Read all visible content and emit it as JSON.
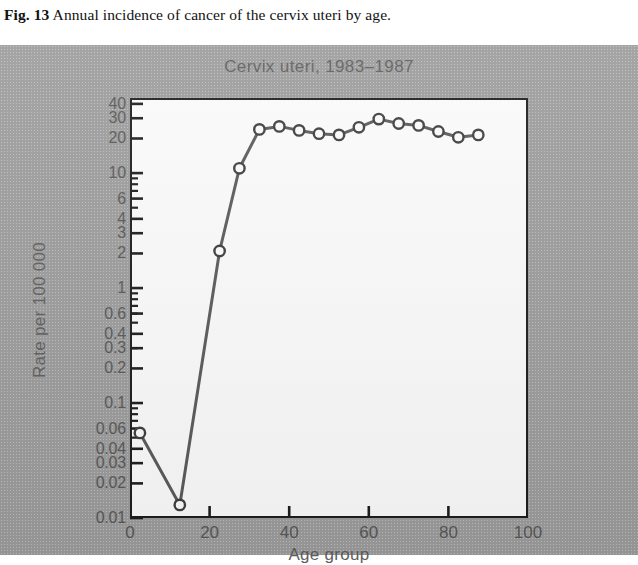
{
  "caption": {
    "figure_number": "Fig. 13",
    "text": "Annual incidence of cancer of the cervix uteri by age."
  },
  "chart_data": {
    "type": "line",
    "title": "Cervix uteri, 1983–1987",
    "xlabel": "Age group",
    "ylabel": "Rate per 100 000",
    "xlim": [
      0,
      100
    ],
    "ylim": [
      0.01,
      45
    ],
    "yscale": "log",
    "grid": false,
    "legend": null,
    "xticks": [
      0,
      20,
      40,
      60,
      80,
      100
    ],
    "xtick_labels": [
      "0",
      "20",
      "40",
      "60",
      "80",
      "100"
    ],
    "yticks": [
      40,
      30,
      20,
      10,
      6,
      4,
      3,
      2,
      1,
      0.6,
      0.4,
      0.3,
      0.2,
      0.1,
      0.06,
      0.04,
      0.03,
      0.02,
      0.01
    ],
    "ytick_labels": [
      "40",
      "30",
      "20",
      "10",
      "6",
      "4",
      "3",
      "2",
      "1",
      "0.6",
      "0.4",
      "0.3",
      "0.2",
      "0.1",
      "0.06",
      "0.04",
      "0.03",
      "0.02",
      "0.01"
    ],
    "marker": "open-circle",
    "x": [
      2.5,
      12.5,
      22.5,
      27.5,
      32.5,
      37.5,
      42.5,
      47.5,
      52.5,
      57.5,
      62.5,
      67.5,
      72.5,
      77.5,
      82.5,
      87.5
    ],
    "values": [
      0.055,
      0.013,
      2.1,
      11.0,
      24.0,
      25.5,
      23.5,
      22.0,
      21.5,
      25.0,
      29.5,
      27.0,
      26.0,
      23.0,
      20.5,
      21.5
    ]
  }
}
